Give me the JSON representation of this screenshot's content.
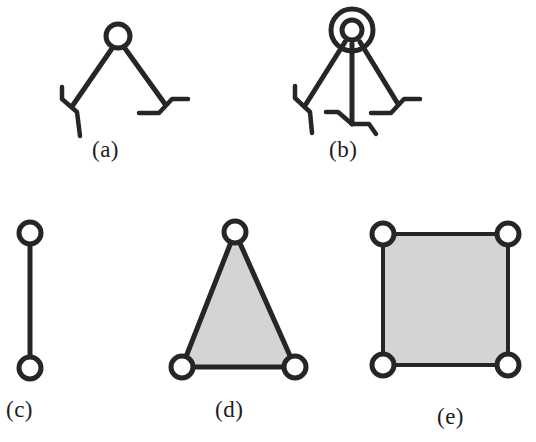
{
  "figure": {
    "width": 536,
    "height": 442,
    "background_color": "#ffffff",
    "stroke_color": "#262626",
    "fill_gray": "#d4d4d4",
    "node_fill": "#ffffff",
    "panels": [
      {
        "id": "a",
        "label": "(a)",
        "label_x": 92,
        "label_y": 137,
        "type": "two-legged-linkage",
        "description": "Single hub joint with two splayed legs ending in bent feet",
        "hub": {
          "cx": 118,
          "cy": 36,
          "r": 12,
          "rings": 1
        },
        "legs": [
          {
            "from": [
              110,
              46
            ],
            "to": [
              72,
              104
            ],
            "foot": "left-bent"
          },
          {
            "from": [
              127,
              46
            ],
            "to": [
              166,
              104
            ],
            "foot": "right-bent"
          }
        ]
      },
      {
        "id": "b",
        "label": "(b)",
        "label_x": 329,
        "label_y": 137,
        "type": "three-legged-linkage",
        "description": "Double-ringed hub joint with three legs ending in bent feet",
        "hub": {
          "cx": 352,
          "cy": 30,
          "r": 10,
          "outer_r": 21,
          "rings": 2
        },
        "legs": [
          {
            "from": [
              345,
              40
            ],
            "to": [
              305,
              104
            ],
            "foot": "left-bent"
          },
          {
            "from": [
              352,
              42
            ],
            "to": [
              352,
              122
            ],
            "foot": "center-bent"
          },
          {
            "from": [
              360,
              40
            ],
            "to": [
              398,
              104
            ],
            "foot": "right-bent"
          }
        ]
      },
      {
        "id": "c",
        "label": "(c)",
        "label_x": 6,
        "label_y": 397,
        "type": "segment",
        "description": "Two nodes joined by a single vertical edge, no fill",
        "filled": false,
        "nodes": [
          [
            30,
            233
          ],
          [
            30,
            368
          ]
        ],
        "edges": [
          [
            0,
            1
          ]
        ]
      },
      {
        "id": "d",
        "label": "(d)",
        "label_x": 215,
        "label_y": 397,
        "type": "triangle",
        "description": "Three nodes forming a gray-filled triangle",
        "filled": true,
        "nodes": [
          [
            235,
            232
          ],
          [
            182,
            367
          ],
          [
            295,
            367
          ]
        ],
        "edges": [
          [
            0,
            1
          ],
          [
            1,
            2
          ],
          [
            2,
            0
          ]
        ]
      },
      {
        "id": "e",
        "label": "(e)",
        "label_x": 437,
        "label_y": 404,
        "type": "square",
        "description": "Four nodes forming a gray-filled square",
        "filled": true,
        "nodes": [
          [
            383,
            234
          ],
          [
            508,
            234
          ],
          [
            508,
            365
          ],
          [
            383,
            365
          ]
        ],
        "edges": [
          [
            0,
            1
          ],
          [
            1,
            2
          ],
          [
            2,
            3
          ],
          [
            3,
            0
          ]
        ]
      }
    ],
    "node_radius": 11,
    "node_stroke_width": 5,
    "edge_stroke_width": 5,
    "leg_stroke_width": 5
  }
}
